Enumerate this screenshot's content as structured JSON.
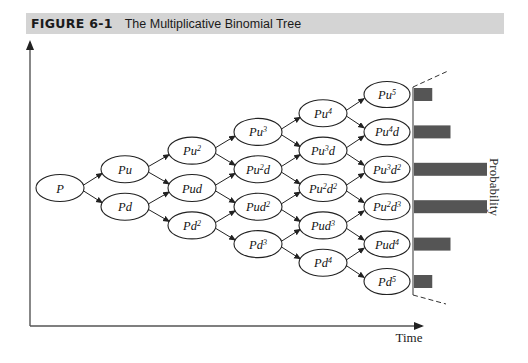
{
  "figure": {
    "number": "FIGURE 6-1",
    "title": "The Multiplicative Binomial Tree",
    "title_bar_color": "#d4d4d4"
  },
  "axes": {
    "x_label": "Time",
    "y_label": "Probability"
  },
  "tree": {
    "levels": [
      [
        {
          "base": "P",
          "sup1": "",
          "mid": "",
          "sup2": ""
        }
      ],
      [
        {
          "base": "Pu",
          "sup1": "",
          "mid": "",
          "sup2": ""
        },
        {
          "base": "Pd",
          "sup1": "",
          "mid": "",
          "sup2": ""
        }
      ],
      [
        {
          "base": "Pu",
          "sup1": "2",
          "mid": "",
          "sup2": ""
        },
        {
          "base": "Pud",
          "sup1": "",
          "mid": "",
          "sup2": ""
        },
        {
          "base": "Pd",
          "sup1": "2",
          "mid": "",
          "sup2": ""
        }
      ],
      [
        {
          "base": "Pu",
          "sup1": "3",
          "mid": "",
          "sup2": ""
        },
        {
          "base": "Pu",
          "sup1": "2",
          "mid": "d",
          "sup2": ""
        },
        {
          "base": "Pud",
          "sup1": "2",
          "mid": "",
          "sup2": ""
        },
        {
          "base": "Pd",
          "sup1": "3",
          "mid": "",
          "sup2": ""
        }
      ],
      [
        {
          "base": "Pu",
          "sup1": "4",
          "mid": "",
          "sup2": ""
        },
        {
          "base": "Pu",
          "sup1": "3",
          "mid": "d",
          "sup2": ""
        },
        {
          "base": "Pu",
          "sup1": "2",
          "mid": "d",
          "sup2": "2"
        },
        {
          "base": "Pud",
          "sup1": "3",
          "mid": "",
          "sup2": ""
        },
        {
          "base": "Pd",
          "sup1": "4",
          "mid": "",
          "sup2": ""
        }
      ],
      [
        {
          "base": "Pu",
          "sup1": "5",
          "mid": "",
          "sup2": ""
        },
        {
          "base": "Pu",
          "sup1": "4",
          "mid": "d",
          "sup2": ""
        },
        {
          "base": "Pu",
          "sup1": "3",
          "mid": "d",
          "sup2": "2"
        },
        {
          "base": "Pu",
          "sup1": "2",
          "mid": "d",
          "sup2": "3"
        },
        {
          "base": "Pud",
          "sup1": "4",
          "mid": "",
          "sup2": ""
        },
        {
          "base": "Pd",
          "sup1": "5",
          "mid": "",
          "sup2": ""
        }
      ]
    ]
  },
  "probability_bars": {
    "labels": [
      "Pu5",
      "Pu4d",
      "Pu3d2",
      "Pu2d3",
      "Pud4",
      "Pd5"
    ],
    "relative_values": [
      1,
      2,
      4,
      4,
      2,
      1
    ],
    "color": "#555555"
  }
}
